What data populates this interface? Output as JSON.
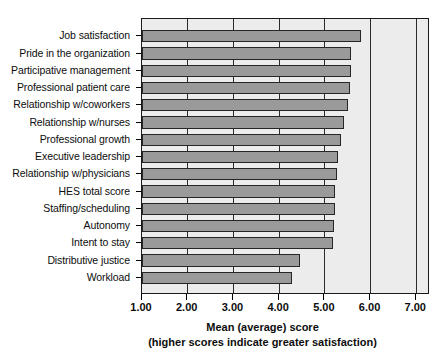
{
  "chart_data": {
    "type": "bar",
    "orientation": "horizontal",
    "title": "",
    "xlabel": "Mean (average) score",
    "xlabel_sub": "(higher scores indicate greater satisfaction)",
    "ylabel": "",
    "xlim": [
      1.0,
      7.3
    ],
    "xticks": [
      1.0,
      2.0,
      3.0,
      4.0,
      5.0,
      6.0,
      7.0
    ],
    "xticklabels": [
      "1.00",
      "2.00",
      "3.00",
      "4.00",
      "5.00",
      "6.00",
      "7.00"
    ],
    "grid": true,
    "legend": null,
    "categories": [
      "Job satisfaction",
      "Pride in the organization",
      "Participative management",
      "Professional patient care",
      "Relationship w/coworkers",
      "Relationship w/nurses",
      "Professional growth",
      "Executive leadership",
      "Relationship w/physicians",
      "HES total score",
      "Staffing/scheduling",
      "Autonomy",
      "Intent to stay",
      "Distributive justice",
      "Workload"
    ],
    "values": [
      5.8,
      5.58,
      5.57,
      5.56,
      5.5,
      5.42,
      5.35,
      5.28,
      5.27,
      5.23,
      5.22,
      5.2,
      5.17,
      4.46,
      4.29
    ],
    "bar_facecolor": "#9a9a9a",
    "bar_edgecolor": "#262626",
    "plot_bgcolor": "#ececec",
    "figure_bgcolor": "#ffffff"
  }
}
